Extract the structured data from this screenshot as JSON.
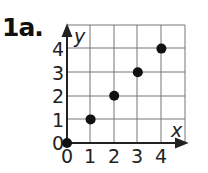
{
  "problem_label": "1a.",
  "chart_data": {
    "type": "scatter",
    "title": "",
    "xlabel": "x",
    "ylabel": "y",
    "x": [
      0,
      1,
      2,
      3,
      4
    ],
    "y": [
      0,
      1,
      2,
      3,
      4
    ],
    "xticks": [
      "0",
      "1",
      "2",
      "3",
      "4"
    ],
    "yticks": [
      "0",
      "1",
      "2",
      "3",
      "4"
    ],
    "xlim": [
      0,
      5
    ],
    "ylim": [
      0,
      5
    ],
    "grid": true,
    "legend": null
  }
}
